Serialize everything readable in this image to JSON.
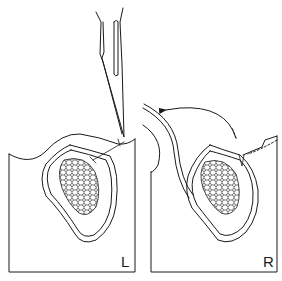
{
  "diagram": {
    "panels": [
      {
        "id": "left",
        "label": "L"
      },
      {
        "id": "right",
        "label": "R"
      }
    ],
    "colors": {
      "line": "#1a1a1a",
      "background": "#ffffff"
    },
    "icons": [
      "scalpel-icon",
      "arrow-icon",
      "tumor-mass"
    ]
  }
}
